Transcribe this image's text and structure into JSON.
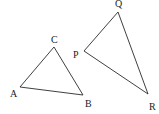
{
  "diagram": {
    "type": "geometry",
    "triangles": [
      {
        "name": "ABC",
        "vertices": {
          "A": {
            "label": "A",
            "x": 20,
            "y": 87,
            "lx": 10,
            "ly": 97
          },
          "B": {
            "label": "B",
            "x": 83,
            "y": 95,
            "lx": 85,
            "ly": 107
          },
          "C": {
            "label": "C",
            "x": 54,
            "y": 47,
            "lx": 51,
            "ly": 43
          }
        }
      },
      {
        "name": "PQR",
        "vertices": {
          "P": {
            "label": "P",
            "x": 84,
            "y": 51,
            "lx": 73,
            "ly": 58
          },
          "Q": {
            "label": "Q",
            "x": 118,
            "y": 12,
            "lx": 115,
            "ly": 7
          },
          "R": {
            "label": "R",
            "x": 148,
            "y": 94,
            "lx": 149,
            "ly": 110
          }
        }
      }
    ],
    "colors": {
      "line": "#2a2a2a",
      "text": "#222222",
      "background": "#ffffff"
    }
  }
}
